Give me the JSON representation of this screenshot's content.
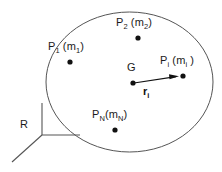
{
  "figure": {
    "kind": "system-of-particles-diagram",
    "width": 222,
    "height": 172,
    "background_color": "#ffffff",
    "ink_color": "#1a1a1a",
    "boundary_color": "#555555"
  },
  "boundary": {
    "shape": "ellipse",
    "center_x": 129.5,
    "center_y": 82,
    "radius_x": 83.5,
    "radius_y": 70,
    "stroke": "#555555",
    "fill": "none"
  },
  "particles": [
    {
      "key": "P2",
      "base": "P",
      "base_sub": "2",
      "mass_open": " (m",
      "mass_sub": "2",
      "mass_close": ")",
      "dot_x": 138,
      "dot_y": 38,
      "label_x": 116,
      "label_y": 17
    },
    {
      "key": "P1",
      "base": "P",
      "base_sub": "1",
      "mass_open": " (m",
      "mass_sub": "1",
      "mass_close": ")",
      "dot_x": 70,
      "dot_y": 62,
      "label_x": 48,
      "label_y": 41
    },
    {
      "key": "Pi",
      "base": "P",
      "base_sub": "i",
      "mass_open": " (m",
      "mass_sub": "i",
      "mass_close": " )",
      "dot_x": 183,
      "dot_y": 76,
      "label_x": 160,
      "label_y": 55
    },
    {
      "key": "PN",
      "base": "P",
      "base_sub": "N",
      "mass_open": "(m",
      "mass_sub": "N",
      "mass_close": ")",
      "dot_x": 115,
      "dot_y": 130,
      "label_x": 92,
      "label_y": 109
    }
  ],
  "centroid": {
    "label": "G",
    "dot_x": 133,
    "dot_y": 83,
    "label_x": 127,
    "label_y": 62
  },
  "vector": {
    "base": "r",
    "sub": "i",
    "from_x": 134,
    "from_y": 83,
    "to_x": 181,
    "to_y": 76,
    "label_x": 143,
    "label_y": 86,
    "stroke": "#111111"
  },
  "reference_frame": {
    "label": "R",
    "label_x": 20,
    "label_y": 119,
    "origin_x": 42,
    "origin_y": 135,
    "axis_up_x": 42,
    "axis_up_y": 103,
    "axis_right_x": 80,
    "axis_right_y": 135,
    "axis_diag_x": 12,
    "axis_diag_y": 162,
    "stroke": "#555555"
  }
}
